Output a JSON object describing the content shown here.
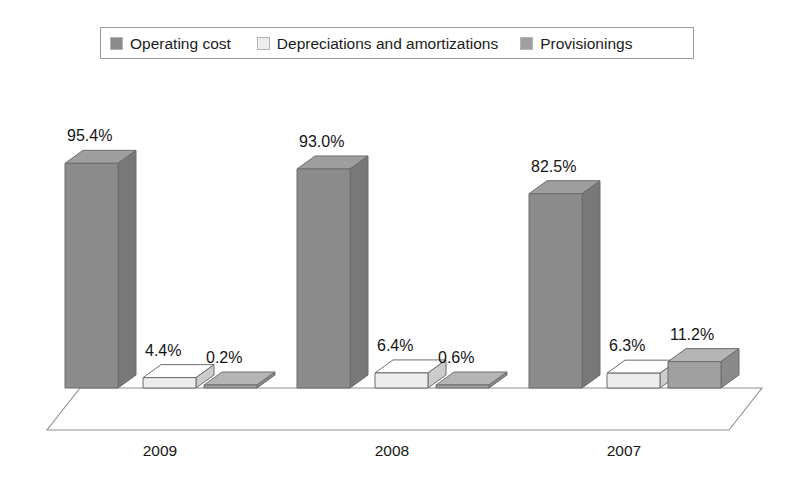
{
  "legend": {
    "items": [
      {
        "label": "Operating cost",
        "color": "#8c8c8c",
        "icon": "legend-swatch-icon"
      },
      {
        "label": "Depreciations and amortizations",
        "color": "#ededed",
        "icon": "legend-swatch-icon"
      },
      {
        "label": "Provisionings",
        "color": "#a0a0a0",
        "icon": "legend-swatch-icon"
      }
    ]
  },
  "axis": {
    "categories": [
      "2009",
      "2008",
      "2007"
    ]
  },
  "values": {
    "g0s0": "95.4%",
    "g0s1": "4.4%",
    "g0s2": "0.2%",
    "g1s0": "93.0%",
    "g1s1": "6.4%",
    "g1s2": "0.6%",
    "g2s0": "82.5%",
    "g2s1": "6.3%",
    "g2s2": "11.2%"
  },
  "chart_data": {
    "type": "bar",
    "style": "3d-clustered-column",
    "title": "",
    "xlabel": "",
    "ylabel": "",
    "unit": "%",
    "categories": [
      "2009",
      "2008",
      "2007"
    ],
    "series": [
      {
        "name": "Operating cost",
        "color": "#8c8c8c",
        "values": [
          95.4,
          93.0,
          82.5
        ]
      },
      {
        "name": "Depreciations and amortizations",
        "color": "#ededed",
        "values": [
          4.4,
          6.4,
          6.3
        ]
      },
      {
        "name": "Provisionings",
        "color": "#a0a0a0",
        "values": [
          0.2,
          0.6,
          11.2
        ]
      }
    ],
    "data_labels": [
      [
        "95.4%",
        "4.4%",
        "0.2%"
      ],
      [
        "93.0%",
        "6.4%",
        "0.6%"
      ],
      [
        "82.5%",
        "6.3%",
        "11.2%"
      ]
    ],
    "ylim": [
      0,
      100
    ],
    "grid": false,
    "legend_position": "top",
    "axis_ticks_visible": false
  }
}
